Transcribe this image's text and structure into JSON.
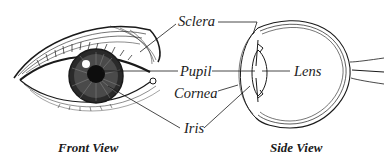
{
  "diagram": {
    "labels": {
      "sclera": "Sclera",
      "pupil": "Pupil",
      "lens": "Lens",
      "cornea": "Cornea",
      "iris": "Iris"
    },
    "captions": {
      "front": "Front View",
      "side": "Side View"
    },
    "colors": {
      "ink": "#1a1a1a",
      "background": "#ffffff"
    }
  }
}
